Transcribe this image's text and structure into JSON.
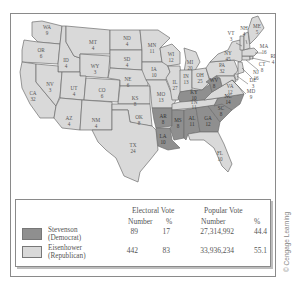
{
  "map": {
    "colors": {
      "democrat": "#8f8f8f",
      "republican": "#d9d9d9",
      "border": "#6f6f6f"
    },
    "states": [
      {
        "abbr": "WA",
        "votes": "9",
        "winner": "R"
      },
      {
        "abbr": "OR",
        "votes": "6",
        "winner": "R"
      },
      {
        "abbr": "CA",
        "votes": "32",
        "winner": "R"
      },
      {
        "abbr": "ID",
        "votes": "4",
        "winner": "R"
      },
      {
        "abbr": "NV",
        "votes": "3",
        "winner": "R"
      },
      {
        "abbr": "MT",
        "votes": "4",
        "winner": "R"
      },
      {
        "abbr": "WY",
        "votes": "3",
        "winner": "R"
      },
      {
        "abbr": "UT",
        "votes": "4",
        "winner": "R"
      },
      {
        "abbr": "CO",
        "votes": "6",
        "winner": "R"
      },
      {
        "abbr": "AZ",
        "votes": "4",
        "winner": "R"
      },
      {
        "abbr": "NM",
        "votes": "4",
        "winner": "R"
      },
      {
        "abbr": "ND",
        "votes": "4",
        "winner": "R"
      },
      {
        "abbr": "SD",
        "votes": "4",
        "winner": "R"
      },
      {
        "abbr": "NE",
        "votes": "6",
        "winner": "R"
      },
      {
        "abbr": "KS",
        "votes": "8",
        "winner": "R"
      },
      {
        "abbr": "OK",
        "votes": "8",
        "winner": "R"
      },
      {
        "abbr": "TX",
        "votes": "24",
        "winner": "R"
      },
      {
        "abbr": "MN",
        "votes": "11",
        "winner": "R"
      },
      {
        "abbr": "IA",
        "votes": "10",
        "winner": "R"
      },
      {
        "abbr": "MO",
        "votes": "13",
        "winner": "R"
      },
      {
        "abbr": "AR",
        "votes": "8",
        "winner": "D"
      },
      {
        "abbr": "LA",
        "votes": "10",
        "winner": "D"
      },
      {
        "abbr": "WI",
        "votes": "12",
        "winner": "R"
      },
      {
        "abbr": "IL",
        "votes": "27",
        "winner": "R"
      },
      {
        "abbr": "MI",
        "votes": "20",
        "winner": "R"
      },
      {
        "abbr": "IN",
        "votes": "13",
        "winner": "R"
      },
      {
        "abbr": "OH",
        "votes": "25",
        "winner": "R"
      },
      {
        "abbr": "KY",
        "votes": "10",
        "winner": "D"
      },
      {
        "abbr": "TN",
        "votes": "11",
        "winner": "R"
      },
      {
        "abbr": "MS",
        "votes": "8",
        "winner": "D"
      },
      {
        "abbr": "AL",
        "votes": "11",
        "winner": "D"
      },
      {
        "abbr": "GA",
        "votes": "12",
        "winner": "D"
      },
      {
        "abbr": "FL",
        "votes": "10",
        "winner": "R"
      },
      {
        "abbr": "SC",
        "votes": "8",
        "winner": "D"
      },
      {
        "abbr": "NC",
        "votes": "14",
        "winner": "D"
      },
      {
        "abbr": "VA",
        "votes": "12",
        "winner": "R"
      },
      {
        "abbr": "WV",
        "votes": "8",
        "winner": "D"
      },
      {
        "abbr": "PA",
        "votes": "32",
        "winner": "R"
      },
      {
        "abbr": "NY",
        "votes": "45",
        "winner": "R"
      },
      {
        "abbr": "ME",
        "votes": "5",
        "winner": "R"
      },
      {
        "abbr": "NH",
        "votes": "4",
        "winner": "R"
      },
      {
        "abbr": "VT",
        "votes": "3",
        "winner": "R"
      },
      {
        "abbr": "MA",
        "votes": "16",
        "winner": "R"
      },
      {
        "abbr": "RI",
        "votes": "4",
        "winner": "R"
      },
      {
        "abbr": "CT",
        "votes": "8",
        "winner": "R"
      },
      {
        "abbr": "NJ",
        "votes": "16",
        "winner": "R"
      },
      {
        "abbr": "DE",
        "votes": "3",
        "winner": "R"
      },
      {
        "abbr": "MD",
        "votes": "9",
        "winner": "R"
      }
    ]
  },
  "table": {
    "headers": {
      "electoral_vote": "Electoral Vote",
      "popular_vote": "Popular Vote",
      "number": "Number",
      "percent": "%"
    },
    "rows": [
      {
        "name": "Stevenson",
        "party": "(Democrat)",
        "color": "#8f8f8f",
        "electoral_number": "89",
        "electoral_percent": "17",
        "popular_number": "27,314,992",
        "popular_percent": "44.4"
      },
      {
        "name": "Eisenhower",
        "party": "(Republican)",
        "color": "#d9d9d9",
        "electoral_number": "442",
        "electoral_percent": "83",
        "popular_number": "33,936,234",
        "popular_percent": "55.1"
      }
    ]
  },
  "credit": "© Cengage Learning"
}
